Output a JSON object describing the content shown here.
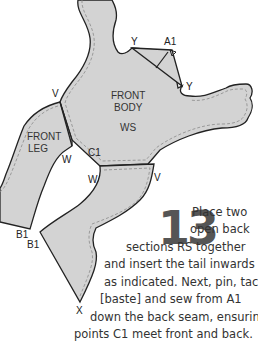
{
  "diagram": {
    "pieces": {
      "front_body": {
        "line1": "FRONT",
        "line2": "BODY",
        "note": "WS"
      },
      "front_leg": {
        "line1": "FRONT",
        "line2": "LEG"
      }
    },
    "points": {
      "y_top": "Y",
      "a1": "A1",
      "y_right": "Y",
      "v_left": "V",
      "w_upper": "W",
      "c1": "C1",
      "w_lower": "W",
      "v_right": "V",
      "b1_left": "B1",
      "b1_right": "B1",
      "x": "X"
    },
    "colors": {
      "fill": "#d3d3d3",
      "outline": "#222222",
      "stitch": "#8a8a8a"
    }
  },
  "instructions": {
    "step_number": "13",
    "lines": [
      "Place two",
      "open back",
      "sections RS together",
      "and insert the tail inwards",
      "as indicated. Next, pin, tack",
      "[baste] and sew from A1",
      "down the back seam, ensuring",
      "points C1 meet front and back."
    ]
  }
}
